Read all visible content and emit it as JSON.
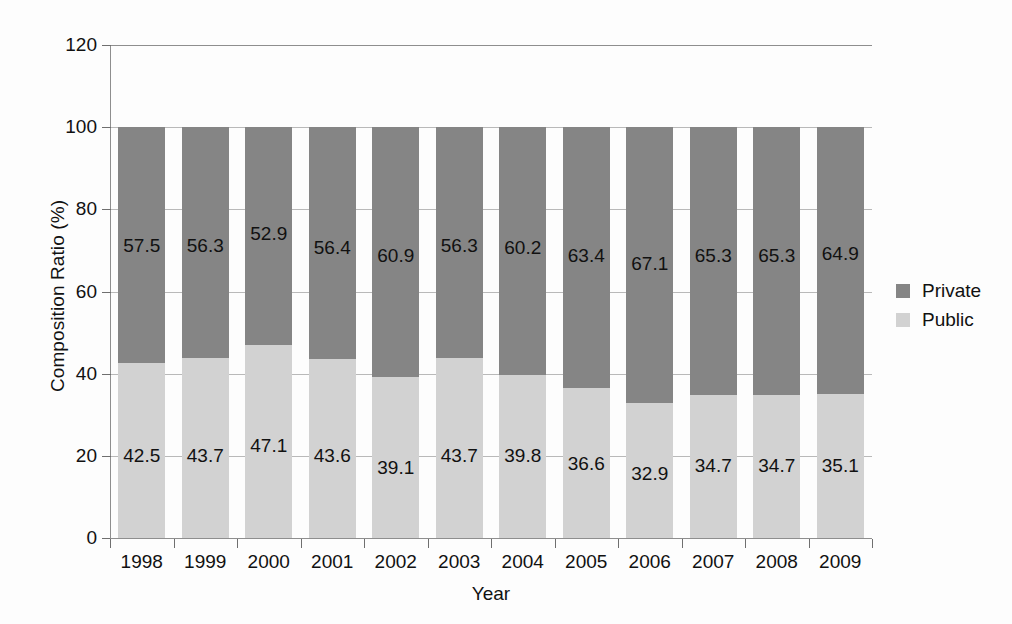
{
  "chart_data": {
    "type": "bar",
    "subtype": "stacked-100-percent",
    "title": "",
    "xlabel": "Year",
    "ylabel": "Composition Ratio (%)",
    "categories": [
      "1998",
      "1999",
      "2000",
      "2001",
      "2002",
      "2003",
      "2004",
      "2005",
      "2006",
      "2007",
      "2008",
      "2009"
    ],
    "series": [
      {
        "name": "Private",
        "color": "#858585",
        "values": [
          57.5,
          56.3,
          52.9,
          56.4,
          60.9,
          56.3,
          60.2,
          63.4,
          67.1,
          65.3,
          65.3,
          64.9
        ]
      },
      {
        "name": "Public",
        "color": "#d2d2d2",
        "values": [
          42.5,
          43.7,
          47.1,
          43.6,
          39.1,
          43.7,
          39.8,
          36.6,
          32.9,
          34.7,
          34.7,
          35.1
        ]
      }
    ],
    "stack_order": [
      "Public",
      "Private"
    ],
    "ylim": [
      0,
      120
    ],
    "yticks": [
      0,
      20,
      40,
      60,
      80,
      100,
      120
    ],
    "ytick_labels": [
      "0",
      "20",
      "40",
      "60",
      "80",
      "100",
      "120"
    ],
    "grid": true,
    "grid_axis": "y",
    "legend_position": "right",
    "legend": [
      "Private",
      "Public"
    ],
    "data_labels": true
  }
}
